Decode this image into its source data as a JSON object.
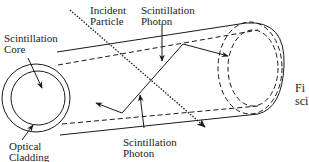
{
  "labels": {
    "incident_particle": [
      "Incident",
      "Particle"
    ],
    "photon_top": [
      "Scintillation",
      "Photon"
    ],
    "core": [
      "Scintillation",
      "Core"
    ],
    "cladding": [
      "Optical",
      "Cladding"
    ],
    "photon_bottom": [
      "Scintillation",
      "Photon"
    ]
  },
  "caption_fragment": [
    "Fi",
    "sci"
  ],
  "colors": {
    "stroke": "#1a1a1a",
    "background": "#ffffff"
  }
}
